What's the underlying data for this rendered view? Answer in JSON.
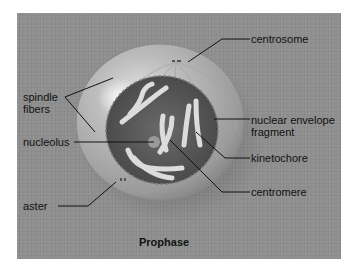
{
  "diagram": {
    "title": "Prophase",
    "labels": {
      "centrosome": "centrosome",
      "spindle_fibers_line1": "spindle",
      "spindle_fibers_line2": "fibers",
      "nuclear_envelope_line1": "nuclear envelope",
      "nuclear_envelope_line2": "fragment",
      "nucleolus": "nucleolus",
      "kinetochore": "kinetochore",
      "centromere": "centromere",
      "aster": "aster"
    },
    "colors": {
      "panel": "#8f8f8f",
      "cell_outer": "#b4b4b4",
      "nucleus": "#5a5a5a",
      "chromosome": "#d8d8d8",
      "leader_line": "#111111"
    }
  }
}
